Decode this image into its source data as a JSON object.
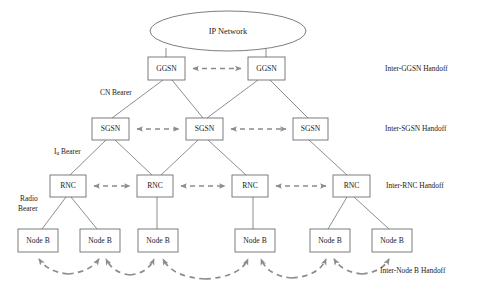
{
  "diagram": {
    "colors": {
      "box_stroke": "#6e6e6e",
      "solid_link": "#7a7a7a",
      "dashed_link": "#8c8c8c",
      "background": "#ffffff",
      "text": "#1a1a1a"
    },
    "cloud": {
      "label": "IP Network",
      "shape": "ellipse",
      "cx": 228,
      "cy": 31,
      "rx": 78,
      "ry": 20
    },
    "tiers": [
      {
        "id": "ggsn-tier",
        "node_label": "GGSN",
        "handoff_label": "Inter-GGSN Handoff",
        "y": 57,
        "height": 23,
        "nodes": [
          {
            "label": "GGSN",
            "x": 148,
            "width": 37
          },
          {
            "label": "GGSN",
            "x": 248,
            "width": 37
          }
        ],
        "peer_links": [
          {
            "from": 185,
            "to": 248,
            "y": 68.5,
            "style": "double-arrow-dashed"
          }
        ]
      },
      {
        "id": "sgsn-tier",
        "node_label": "SGSN",
        "handoff_label": "Inter-SGSN Handoff",
        "y": 118,
        "height": 22,
        "nodes": [
          {
            "label": "SGSN",
            "x": 92,
            "width": 37
          },
          {
            "label": "SGSN",
            "x": 186,
            "width": 37
          },
          {
            "label": "SGSN",
            "x": 293,
            "width": 35
          }
        ],
        "peer_links": [
          {
            "from": 129,
            "to": 186,
            "y": 129,
            "style": "double-arrow-dashed"
          },
          {
            "from": 223,
            "to": 293,
            "y": 129,
            "style": "double-arrow-dashed"
          }
        ]
      },
      {
        "id": "rnc-tier",
        "node_label": "RNC",
        "handoff_label": "Inter-RNC Handoff",
        "y": 175,
        "height": 22,
        "nodes": [
          {
            "label": "RNC",
            "x": 50,
            "width": 36
          },
          {
            "label": "RNC",
            "x": 137,
            "width": 36
          },
          {
            "label": "RNC",
            "x": 232,
            "width": 36
          },
          {
            "label": "RNC",
            "x": 333,
            "width": 37
          }
        ],
        "peer_links": [
          {
            "from": 86,
            "to": 137,
            "y": 186,
            "style": "double-arrow-dashed"
          },
          {
            "from": 173,
            "to": 232,
            "y": 186,
            "style": "double-arrow-dashed"
          },
          {
            "from": 268,
            "to": 333,
            "y": 186,
            "style": "double-arrow-dashed"
          }
        ]
      },
      {
        "id": "nodeb-tier",
        "node_label": "Node B",
        "handoff_label": "Inter-Node B Handoff",
        "y": 229,
        "height": 23,
        "nodes": [
          {
            "label": "Node B",
            "x": 18,
            "width": 40
          },
          {
            "label": "Node B",
            "x": 80,
            "width": 40
          },
          {
            "label": "Node B",
            "x": 138,
            "width": 40
          },
          {
            "label": "Node B",
            "x": 235,
            "width": 40
          },
          {
            "label": "Node B",
            "x": 310,
            "width": 40
          },
          {
            "label": "Node B",
            "x": 372,
            "width": 40
          }
        ],
        "peer_links": []
      }
    ],
    "bearer_labels": [
      {
        "id": "cn-bearer",
        "text": "CN Bearer",
        "x": 100,
        "y": 93,
        "subscript": null
      },
      {
        "id": "iu-bearer",
        "text": "I",
        "subscript": "u",
        "suffix": " Bearer",
        "x": 54,
        "y": 152
      },
      {
        "id": "radio-bearer-line1",
        "text": "Radio",
        "x": 20,
        "y": 199,
        "subscript": null
      },
      {
        "id": "radio-bearer-line2",
        "text": "Bearer",
        "x": 18,
        "y": 209,
        "subscript": null
      }
    ],
    "handoff_labels": [
      {
        "id": "inter-ggsn-handoff",
        "text": "Inter-GGSN Handoff",
        "x": 385,
        "y": 69
      },
      {
        "id": "inter-sgsn-handoff",
        "text": "Inter-SGSN Handoff",
        "x": 385,
        "y": 129
      },
      {
        "id": "inter-rnc-handoff",
        "text": "Inter-RNC Handoff",
        "x": 386,
        "y": 186
      },
      {
        "id": "inter-nodeb-handoff",
        "text": "Inter-Node B Handoff",
        "x": 380,
        "y": 271
      }
    ],
    "tree_links": [
      {
        "from": "ip-network",
        "to": "ggsn-1",
        "x1": 166,
        "y1": 48,
        "x2": 166,
        "y2": 57
      },
      {
        "from": "ip-network",
        "to": "ggsn-2",
        "x1": 266,
        "y1": 48,
        "x2": 266,
        "y2": 57
      },
      {
        "from": "ggsn-1",
        "to": "sgsn-1",
        "x1": 163,
        "y1": 80,
        "x2": 112,
        "y2": 118
      },
      {
        "from": "ggsn-1",
        "to": "sgsn-2",
        "x1": 172,
        "y1": 80,
        "x2": 203,
        "y2": 118
      },
      {
        "from": "ggsn-2",
        "to": "sgsn-2",
        "x1": 258,
        "y1": 80,
        "x2": 207,
        "y2": 118
      },
      {
        "from": "ggsn-2",
        "to": "sgsn-3",
        "x1": 270,
        "y1": 80,
        "x2": 308,
        "y2": 118
      },
      {
        "from": "sgsn-1",
        "to": "rnc-1",
        "x1": 106,
        "y1": 140,
        "x2": 70,
        "y2": 175
      },
      {
        "from": "sgsn-1",
        "to": "rnc-2",
        "x1": 115,
        "y1": 140,
        "x2": 152,
        "y2": 175
      },
      {
        "from": "sgsn-2",
        "to": "rnc-2",
        "x1": 198,
        "y1": 140,
        "x2": 160,
        "y2": 175
      },
      {
        "from": "sgsn-2",
        "to": "rnc-3",
        "x1": 208,
        "y1": 140,
        "x2": 246,
        "y2": 175
      },
      {
        "from": "sgsn-3",
        "to": "rnc-4",
        "x1": 309,
        "y1": 140,
        "x2": 347,
        "y2": 175
      },
      {
        "from": "rnc-1",
        "to": "nodeb-1",
        "x1": 66,
        "y1": 197,
        "x2": 42,
        "y2": 229
      },
      {
        "from": "rnc-1",
        "to": "nodeb-2",
        "x1": 71,
        "y1": 197,
        "x2": 97,
        "y2": 229
      },
      {
        "from": "rnc-2",
        "to": "nodeb-3",
        "x1": 157,
        "y1": 197,
        "x2": 157,
        "y2": 229
      },
      {
        "from": "rnc-3",
        "to": "nodeb-4",
        "x1": 253,
        "y1": 197,
        "x2": 253,
        "y2": 229
      },
      {
        "from": "rnc-4",
        "to": "nodeb-5",
        "x1": 347,
        "y1": 197,
        "x2": 328,
        "y2": 229
      },
      {
        "from": "rnc-4",
        "to": "nodeb-6",
        "x1": 354,
        "y1": 197,
        "x2": 389,
        "y2": 229
      }
    ],
    "nodeb_handoff_arcs": [
      {
        "id": "arc-1-2",
        "from_x": 38,
        "to_x": 100,
        "peak_y": 278,
        "base_y": 254
      },
      {
        "id": "arc-2-3",
        "from_x": 104,
        "to_x": 155,
        "peak_y": 278,
        "base_y": 254
      },
      {
        "id": "arc-3-4",
        "from_x": 162,
        "to_x": 250,
        "peak_y": 279,
        "base_y": 254
      },
      {
        "id": "arc-4-5",
        "from_x": 260,
        "to_x": 328,
        "peak_y": 279,
        "base_y": 254
      },
      {
        "id": "arc-5-6",
        "from_x": 334,
        "to_x": 392,
        "peak_y": 277,
        "base_y": 254
      }
    ]
  }
}
